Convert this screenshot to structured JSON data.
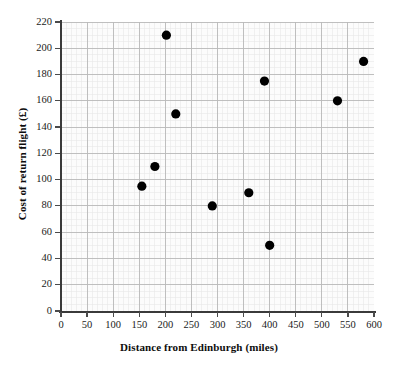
{
  "chart_data": {
    "type": "scatter",
    "title": "",
    "xlabel": "Distance from Edinburgh (miles)",
    "ylabel": "Cost of return flight (£)",
    "xlim": [
      0,
      600
    ],
    "ylim": [
      0,
      220
    ],
    "x_major_step": 50,
    "y_major_step": 20,
    "x_minor_step": 10,
    "y_minor_step": 5,
    "grid": true,
    "legend": "none",
    "x_ticks": [
      0,
      50,
      100,
      150,
      200,
      250,
      300,
      350,
      400,
      450,
      500,
      550,
      600
    ],
    "y_ticks": [
      0,
      20,
      40,
      60,
      80,
      100,
      120,
      140,
      160,
      180,
      200,
      220
    ],
    "x_tick_labels": [
      "0",
      "50",
      "100",
      "150",
      "200",
      "250",
      "300",
      "350",
      "400",
      "450",
      "500",
      "550",
      "600"
    ],
    "y_tick_labels": [
      "0",
      "20",
      "40",
      "60",
      "80",
      "100",
      "120",
      "140",
      "160",
      "180",
      "200",
      "220"
    ],
    "marker": {
      "shape": "circle",
      "color": "#000000",
      "radius_px": 4.6
    },
    "points": [
      {
        "x": 155,
        "y": 95
      },
      {
        "x": 180,
        "y": 110
      },
      {
        "x": 202,
        "y": 210
      },
      {
        "x": 220,
        "y": 150
      },
      {
        "x": 290,
        "y": 80
      },
      {
        "x": 360,
        "y": 90
      },
      {
        "x": 400,
        "y": 50
      },
      {
        "x": 390,
        "y": 175
      },
      {
        "x": 530,
        "y": 160
      },
      {
        "x": 580,
        "y": 190
      }
    ]
  },
  "style": {
    "plot_background": "#fcfcfc",
    "major_gridline_color": "#b9b9b9",
    "minor_gridline_color": "#e8e8e8",
    "axis_color": "#3a3a3a",
    "text_color": "#111111"
  }
}
